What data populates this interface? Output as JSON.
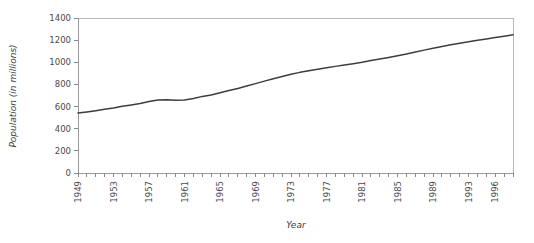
{
  "chart_data": {
    "type": "line",
    "title": "",
    "xlabel": "Year",
    "ylabel": "Population (in millions)",
    "xlim": [
      1949,
      1998
    ],
    "ylim": [
      0,
      1400
    ],
    "grid": false,
    "legend": null,
    "ytick_labels": [
      "0",
      "200",
      "400",
      "600",
      "800",
      "1000",
      "1200",
      "1400"
    ],
    "ytick_values": [
      0,
      200,
      400,
      600,
      800,
      1000,
      1200,
      1400
    ],
    "xtick_labels": [
      "1949",
      "1953",
      "1957",
      "1961",
      "1965",
      "1969",
      "1973",
      "1977",
      "1981",
      "1985",
      "1989",
      "1993",
      "1996"
    ],
    "xtick_values": [
      1949,
      1953,
      1957,
      1961,
      1965,
      1969,
      1973,
      1977,
      1981,
      1985,
      1989,
      1993,
      1996
    ],
    "xtick_label_rotation": 90,
    "x": [
      1949,
      1950,
      1951,
      1952,
      1953,
      1954,
      1955,
      1956,
      1957,
      1958,
      1959,
      1960,
      1961,
      1962,
      1963,
      1964,
      1965,
      1966,
      1967,
      1968,
      1969,
      1970,
      1971,
      1972,
      1973,
      1974,
      1975,
      1976,
      1977,
      1978,
      1979,
      1980,
      1981,
      1982,
      1983,
      1984,
      1985,
      1986,
      1987,
      1988,
      1989,
      1990,
      1991,
      1992,
      1993,
      1994,
      1995,
      1996,
      1997,
      1998
    ],
    "series": [
      {
        "name": "Population",
        "color": "#3d3d3d",
        "values": [
          542,
          552,
          563,
          575,
          588,
          603,
          615,
          628,
          646,
          660,
          662,
          658,
          659,
          673,
          692,
          705,
          725,
          745,
          764,
          785,
          807,
          830,
          852,
          872,
          892,
          909,
          924,
          937,
          950,
          963,
          975,
          987,
          1000,
          1017,
          1030,
          1044,
          1059,
          1075,
          1093,
          1110,
          1127,
          1143,
          1158,
          1172,
          1185,
          1199,
          1211,
          1224,
          1236,
          1248
        ]
      }
    ]
  }
}
